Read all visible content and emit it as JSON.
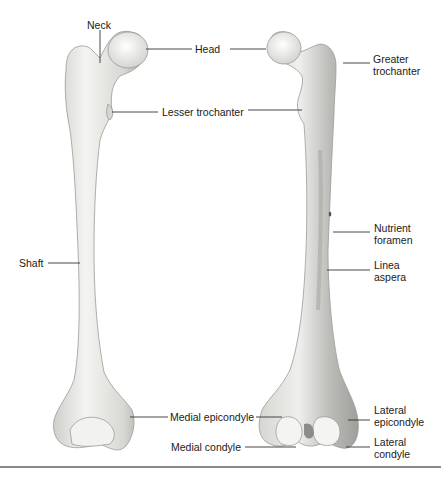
{
  "figure": {
    "labels": {
      "neck": "Neck",
      "head": "Head",
      "greater_trochanter_1": "Greater",
      "greater_trochanter_2": "trochanter",
      "lesser_trochanter": "Lesser trochanter",
      "shaft": "Shaft",
      "nutrient_foramen_1": "Nutrient",
      "nutrient_foramen_2": "foramen",
      "linea_aspera_1": "Linea",
      "linea_aspera_2": "aspera",
      "medial_epicondyle": "Medial epicondyle",
      "medial_condyle": "Medial condyle",
      "lateral_epicondyle_1": "Lateral",
      "lateral_epicondyle_2": "epicondyle",
      "lateral_condyle_1": "Lateral",
      "lateral_condyle_2": "condyle"
    },
    "colors": {
      "bone_fill": "#ededeb",
      "bone_shade": "#c9c9c5",
      "bone_outline": "#9a9a96",
      "leader_line": "#333333",
      "rule": "#8a8a8a"
    }
  }
}
